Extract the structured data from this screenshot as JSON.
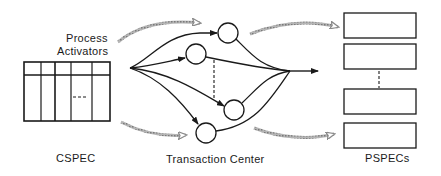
{
  "diagram": {
    "labels": {
      "process_activators_line1": "Process",
      "process_activators_line2": "Activators",
      "cspec": "CSPEC",
      "transaction_center": "Transaction Center",
      "pspecs": "PSPECs"
    },
    "colors": {
      "stroke": "#1a1a1a",
      "flow_arrow": "#9a9a9a",
      "background": "#ffffff"
    },
    "cspec_table": {
      "rows": 2,
      "columns": 5,
      "ellipsis": "---"
    },
    "transaction_center": {
      "node_count": 4,
      "has_dashed_ellipsis": true
    },
    "pspecs": {
      "box_count": 4,
      "has_dashed_ellipsis": true
    },
    "flow_arrows": [
      {
        "from": "cspec",
        "to": "transaction-center",
        "position": "top"
      },
      {
        "from": "cspec",
        "to": "transaction-center",
        "position": "bottom"
      },
      {
        "from": "transaction-center",
        "to": "pspecs",
        "position": "top"
      },
      {
        "from": "transaction-center",
        "to": "pspecs",
        "position": "bottom"
      }
    ]
  }
}
